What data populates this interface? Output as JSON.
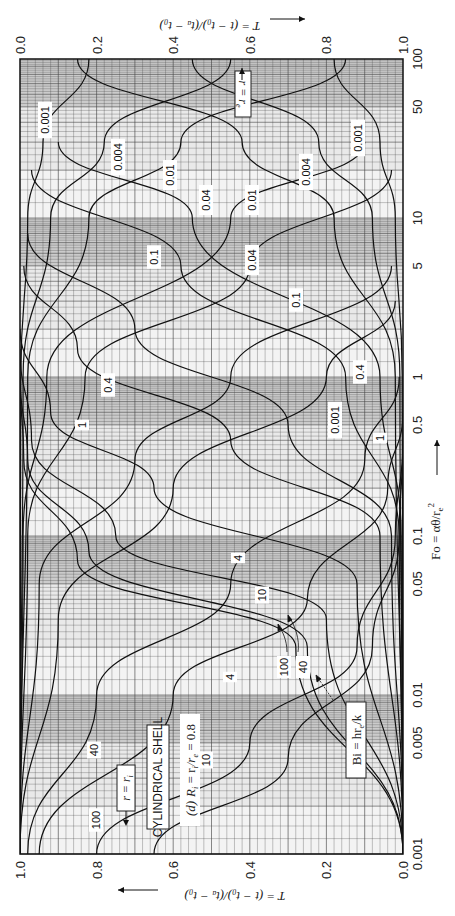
{
  "chart_data": {
    "type": "line",
    "panel_label": "(d)",
    "shell_label": "CYLINDRICAL SHELL",
    "ratio_label": "R_i = r_i/r_e = 0.8",
    "orientation": "rotated 90 degrees clockwise",
    "xlabel": "Fo = αθ/r_e²",
    "xscale": "log",
    "xlim": [
      0.001,
      100
    ],
    "x_ticks": [
      "0.001",
      "0.005",
      "0.01",
      "0.05",
      "0.1",
      "0.5",
      "1",
      "5",
      "10",
      "50",
      "100"
    ],
    "ylabel_inner": "T = (t − t₀)/(t_a − t₀)",
    "ylabel_outer": "T = (t − t₀)/(t_a − t₀)",
    "ylim": [
      0.0,
      1.0
    ],
    "y_ticks_inner_surface": [
      "1.0",
      "0.8",
      "0.6",
      "0.4",
      "0.2",
      "0.0"
    ],
    "y_ticks_outer_surface": [
      "0.0",
      "0.2",
      "0.4",
      "0.6",
      "0.8",
      "1.0"
    ],
    "legend": {
      "parameter": "Bi = hr_e/k",
      "outer_surface_marker": "r = r_e",
      "inner_surface_marker": "r = r_i"
    },
    "grid": true,
    "series_outer_surface_r_re": [
      {
        "name": "Bi = 0.001",
        "Fo": [
          0.001,
          1,
          10,
          30,
          100
        ],
        "T": [
          0.0,
          0.002,
          0.02,
          0.06,
          0.18
        ]
      },
      {
        "name": "Bi = 0.004",
        "Fo": [
          0.001,
          1,
          10,
          30,
          100
        ],
        "T": [
          0.0,
          0.008,
          0.08,
          0.22,
          0.55
        ]
      },
      {
        "name": "Bi = 0.01",
        "Fo": [
          0.001,
          1,
          10,
          30,
          100
        ],
        "T": [
          0.0,
          0.02,
          0.18,
          0.42,
          0.85
        ]
      },
      {
        "name": "Bi = 0.04",
        "Fo": [
          0.001,
          0.1,
          1,
          10,
          30
        ],
        "T": [
          0.0,
          0.008,
          0.07,
          0.55,
          0.9
        ]
      },
      {
        "name": "Bi = 0.1",
        "Fo": [
          0.001,
          0.1,
          1,
          5,
          20
        ],
        "T": [
          0.0,
          0.02,
          0.17,
          0.6,
          0.97
        ]
      },
      {
        "name": "Bi = 0.4",
        "Fo": [
          0.001,
          0.05,
          0.3,
          1,
          5
        ],
        "T": [
          0.0,
          0.05,
          0.3,
          0.55,
          0.97
        ]
      },
      {
        "name": "Bi = 1",
        "Fo": [
          0.001,
          0.03,
          0.2,
          1,
          3
        ],
        "T": [
          0.0,
          0.1,
          0.4,
          0.8,
          0.98
        ]
      },
      {
        "name": "Bi = 4",
        "Fo": [
          0.001,
          0.01,
          0.05,
          0.3,
          1
        ],
        "T": [
          0.02,
          0.2,
          0.55,
          0.9,
          0.99
        ]
      },
      {
        "name": "Bi = 10",
        "Fo": [
          0.001,
          0.01,
          0.04,
          0.2,
          0.6
        ],
        "T": [
          0.05,
          0.4,
          0.75,
          0.96,
          1.0
        ]
      },
      {
        "name": "Bi = 40",
        "Fo": [
          0.001,
          0.005,
          0.02,
          0.1,
          0.4
        ],
        "T": [
          0.2,
          0.6,
          0.88,
          0.98,
          1.0
        ]
      },
      {
        "name": "Bi = 100",
        "Fo": [
          0.001,
          0.004,
          0.02,
          0.1,
          0.4
        ],
        "T": [
          0.35,
          0.7,
          0.92,
          0.99,
          1.0
        ]
      }
    ],
    "series_inner_surface_r_ri": [
      {
        "name": "Bi = 0.001",
        "Fo": [
          0.001,
          1,
          10,
          30,
          100
        ],
        "T": [
          0.0,
          0.002,
          0.02,
          0.06,
          0.18
        ]
      },
      {
        "name": "Bi = 0.004",
        "Fo": [
          0.001,
          1,
          10,
          30,
          100
        ],
        "T": [
          0.0,
          0.008,
          0.08,
          0.22,
          0.55
        ]
      },
      {
        "name": "Bi = 0.01",
        "Fo": [
          0.001,
          1,
          10,
          30,
          100
        ],
        "T": [
          0.0,
          0.02,
          0.18,
          0.42,
          0.85
        ]
      },
      {
        "name": "Bi = 0.04",
        "Fo": [
          0.001,
          0.1,
          1,
          10,
          30
        ],
        "T": [
          0.0,
          0.005,
          0.06,
          0.55,
          0.9
        ]
      },
      {
        "name": "Bi = 0.1",
        "Fo": [
          0.001,
          0.1,
          1,
          5,
          20
        ],
        "T": [
          0.0,
          0.01,
          0.15,
          0.58,
          0.97
        ]
      },
      {
        "name": "Bi = 0.4",
        "Fo": [
          0.001,
          0.1,
          0.5,
          2,
          8
        ],
        "T": [
          0.0,
          0.03,
          0.3,
          0.7,
          0.98
        ]
      },
      {
        "name": "Bi = 1",
        "Fo": [
          0.001,
          0.1,
          0.4,
          1.5,
          5
        ],
        "T": [
          0.0,
          0.06,
          0.45,
          0.85,
          0.99
        ]
      },
      {
        "name": "Bi = 4",
        "Fo": [
          0.001,
          0.05,
          0.2,
          0.6,
          2
        ],
        "T": [
          0.0,
          0.12,
          0.65,
          0.92,
          1.0
        ]
      },
      {
        "name": "Bi = 10",
        "Fo": [
          0.001,
          0.03,
          0.1,
          0.4,
          1.5
        ],
        "T": [
          0.0,
          0.2,
          0.75,
          0.97,
          1.0
        ]
      },
      {
        "name": "Bi = 40",
        "Fo": [
          0.001,
          0.02,
          0.08,
          0.3,
          1
        ],
        "T": [
          0.0,
          0.25,
          0.82,
          0.98,
          1.0
        ]
      },
      {
        "name": "Bi = 100",
        "Fo": [
          0.001,
          0.02,
          0.07,
          0.3,
          1
        ],
        "T": [
          0.0,
          0.28,
          0.85,
          0.99,
          1.0
        ]
      }
    ]
  },
  "labels": {
    "bottom_axis_title": "T = (t − t₀)/(tₐ − t₀)",
    "top_axis_title": "T = (t − t₀)/(tₐ − t₀)",
    "fo_axis_title": "Fo = αθ/r",
    "fo_axis_sub": "e",
    "fo_axis_sup": "2",
    "bi_label": "Bi = hr",
    "bi_sub": "e",
    "bi_tail": "/k",
    "r_re": "r = r",
    "r_re_sub": "e",
    "r_ri": "r = r",
    "r_ri_sub": "i",
    "shell": "CYLINDRICAL SHELL",
    "panel": "(d)",
    "ratio_a": "R",
    "ratio_b": " = r",
    "ratio_c": "/r",
    "ratio_d": " = 0.8"
  },
  "curve_labels_outer": [
    "0.001",
    "0.004",
    "0.01",
    "0.04",
    "0.1",
    "0.4",
    "1",
    "4",
    "10",
    "40",
    "100"
  ],
  "curve_labels_inner": [
    "0.001",
    "0.004",
    "0.01",
    "0.04",
    "0.1",
    "0.4",
    "1",
    "4",
    "10",
    "100",
    "40"
  ]
}
